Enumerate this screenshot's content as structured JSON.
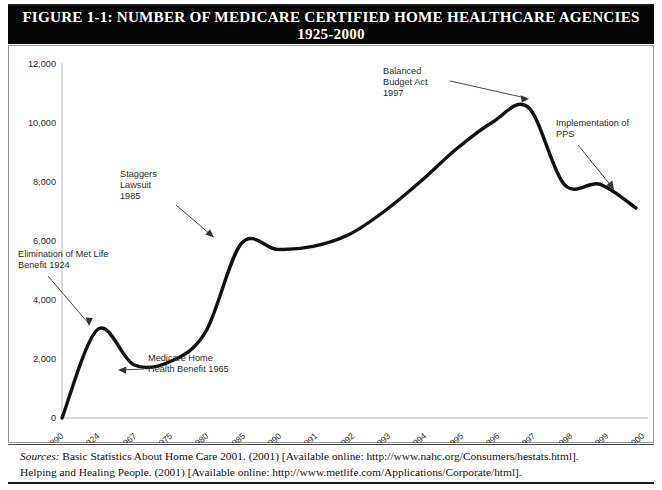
{
  "figure": {
    "title_line1": "FIGURE 1-1: NUMBER OF MEDICARE CERTIFIED HOME HEALTHCARE AGENCIES",
    "title_line2": "1925-2000"
  },
  "sources": {
    "label": "Sources:",
    "line1": " Basic Statistics About Home Care 2001. (2001) [Available online: http://www.nahc.org/Consumers/hestats.html].",
    "line2": "Helping and Healing People. (2001) [Available online: http://www.metlife.com/Applications/Corporate/html]."
  },
  "chart_data": {
    "type": "line",
    "title": "FIGURE 1-1: NUMBER OF MEDICARE CERTIFIED HOME HEALTHCARE AGENCIES 1925-2000",
    "xlabel": "",
    "ylabel": "",
    "grid": false,
    "legend": "none",
    "ylim": [
      0,
      12000
    ],
    "yticks": [
      0,
      2000,
      4000,
      6000,
      8000,
      10000,
      12000
    ],
    "ytick_labels": [
      "0",
      "2,000",
      "4,000",
      "6,000",
      "8,000",
      "10,000",
      "12,000"
    ],
    "categories": [
      "1890",
      "1924",
      "1967",
      "1975",
      "1980",
      "1985",
      "1990",
      "1991",
      "1992",
      "1993",
      "1994",
      "1995",
      "1996",
      "1997",
      "1998",
      "1999",
      "2000"
    ],
    "values": [
      0,
      3000,
      1800,
      1900,
      2900,
      5900,
      5700,
      5800,
      6200,
      7000,
      8000,
      9100,
      10000,
      10500,
      7900,
      7900,
      7100
    ],
    "series": [
      {
        "name": "Medicare certified home healthcare agencies",
        "values": [
          0,
          3000,
          1800,
          1900,
          2900,
          5900,
          5700,
          5800,
          6200,
          7000,
          8000,
          9100,
          10000,
          10500,
          7900,
          7900,
          7100
        ]
      }
    ],
    "annotations": [
      {
        "id": "met-life",
        "lines": [
          "Elimination of Met Life",
          "Benefit 1924"
        ],
        "points_to_year": "1924",
        "points_to_value": 3000
      },
      {
        "id": "medicare-benefit",
        "lines": [
          "Medicare Home",
          "Health Benefit 1965"
        ],
        "points_to_year": "1967",
        "points_to_value": 1800
      },
      {
        "id": "staggers",
        "lines": [
          "Staggers",
          "Lawsuit",
          "1985"
        ],
        "points_to_year": "1985",
        "points_to_value": 6100
      },
      {
        "id": "balanced-budget",
        "lines": [
          "Balanced",
          "Budget Act",
          "1997"
        ],
        "points_to_year": "1997",
        "points_to_value": 10500
      },
      {
        "id": "pps",
        "lines": [
          "Implementation of",
          "PPS"
        ],
        "points_to_year": "2000",
        "points_to_value": 7100
      }
    ],
    "colors": {
      "line": "#111111",
      "axis": "#b8b8b8",
      "text": "#2b2b2b",
      "title_bg": "#050505",
      "title_fg": "#ffffff"
    }
  }
}
